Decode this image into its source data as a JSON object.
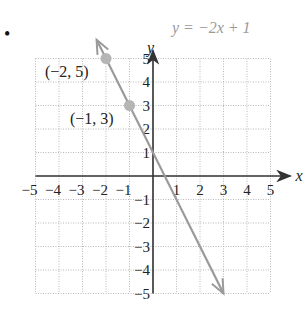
{
  "bullet": "•",
  "chart_data": {
    "type": "line",
    "title": "",
    "equation": "y = −2x + 1",
    "xlabel": "x",
    "ylabel": "y",
    "xlim": [
      -5,
      5
    ],
    "ylim": [
      -5,
      5
    ],
    "grid": true,
    "x_ticks": [
      "−5",
      "−4",
      "−3",
      "−2",
      "−1",
      "1",
      "2",
      "3",
      "4",
      "5"
    ],
    "y_ticks": [
      "5",
      "4",
      "3",
      "2",
      "1",
      "−1",
      "−2",
      "−3",
      "−4",
      "−5"
    ],
    "series": [
      {
        "name": "y = −2x + 1",
        "x": [
          -2.4,
          3
        ],
        "y": [
          5.8,
          -5
        ],
        "color": "#9a9a9a",
        "arrows": "both"
      }
    ],
    "points": [
      {
        "x": -2,
        "y": 5,
        "label": "(−2, 5)"
      },
      {
        "x": -1,
        "y": 3,
        "label": "(−1, 3)"
      }
    ]
  },
  "colors": {
    "line": "#9a9a9a",
    "point": "#b5b5b5",
    "axis": "#333333",
    "grid": "#b8b8b8"
  }
}
